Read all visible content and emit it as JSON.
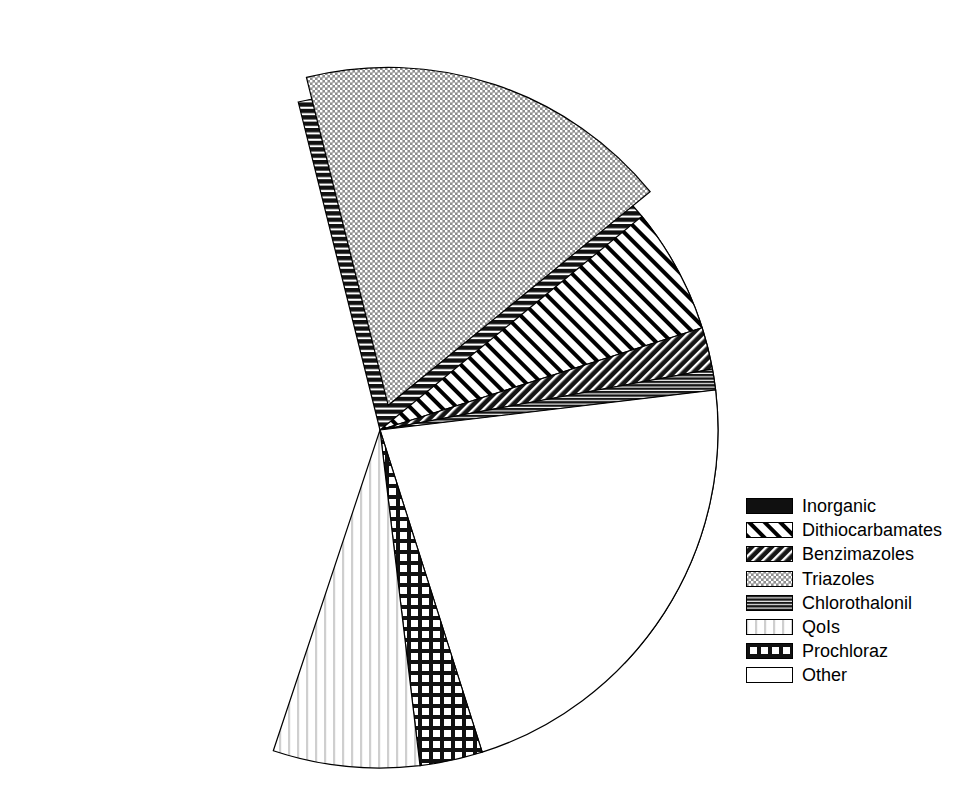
{
  "chart_data": {
    "type": "pie",
    "title": "",
    "subtitle": "",
    "xlabel": "",
    "ylabel": "",
    "legend_position": "right",
    "grid": false,
    "start_angle_deg": -104,
    "direction": "clockwise",
    "center": {
      "x": 380,
      "y": 430
    },
    "radius": 338,
    "categories": [
      "Inorganic",
      "Triazoles",
      "Dithiocarbamates",
      "Benzimazoles",
      "Chlorothalonil",
      "Other",
      "Prochloraz",
      "QoIs"
    ],
    "values": [
      41,
      18,
      6,
      2,
      1,
      22,
      3,
      7
    ],
    "slices": [
      {
        "label": "Inorganic",
        "value": 41,
        "pattern": "horizontal-stripes-dark",
        "fill": "#111111",
        "exploded": false,
        "start_deg": -104,
        "end_deg": 43.6
      },
      {
        "label": "Triazoles",
        "value": 18,
        "pattern": "gray-crosshatch-dots",
        "fill": "#8a8a8a",
        "exploded": true,
        "explode_offset": 26,
        "start_deg": -104,
        "end_deg": -39.2
      },
      {
        "label": "Dithiocarbamates",
        "value": 6,
        "pattern": "diagonal-stripes",
        "fill": "#ffffff",
        "exploded": false,
        "start_deg": -39.2,
        "end_deg": -17.6
      },
      {
        "label": "Benzimazoles",
        "value": 2,
        "pattern": "dense-back-diagonal",
        "fill": "#1a1a1a",
        "exploded": false,
        "start_deg": -17.6,
        "end_deg": -10.4
      },
      {
        "label": "Chlorothalonil",
        "value": 1,
        "pattern": "fine-horizontal-dark",
        "fill": "#1a1a1a",
        "exploded": false,
        "start_deg": -10.4,
        "end_deg": -6.8
      },
      {
        "label": "Other",
        "value": 22,
        "pattern": "solid-white",
        "fill": "#ffffff",
        "exploded": false,
        "start_deg": -6.8,
        "end_deg": 72.4
      },
      {
        "label": "Prochloraz",
        "value": 3,
        "pattern": "grid-crosshatch",
        "fill": "#ffffff",
        "exploded": false,
        "start_deg": 72.4,
        "end_deg": 83.2
      },
      {
        "label": "QoIs",
        "value": 7,
        "pattern": "vertical-stripes-light",
        "fill": "#ffffff",
        "exploded": false,
        "start_deg": 83.2,
        "end_deg": 108.4
      }
    ]
  },
  "legend": {
    "items": [
      {
        "label": "Inorganic",
        "pattern": "solid-black",
        "swatch_name": "legend-swatch-inorganic"
      },
      {
        "label": "Dithiocarbamates",
        "pattern": "diagonal-stripes",
        "swatch_name": "legend-swatch-dithiocarbamates"
      },
      {
        "label": "Benzimazoles",
        "pattern": "dense-back-diagonal",
        "swatch_name": "legend-swatch-benzimazoles"
      },
      {
        "label": "Triazoles",
        "pattern": "gray-crosshatch-dots",
        "swatch_name": "legend-swatch-triazoles"
      },
      {
        "label": "Chlorothalonil",
        "pattern": "fine-horizontal-dark",
        "swatch_name": "legend-swatch-chlorothalonil"
      },
      {
        "label": "QoIs",
        "pattern": "vertical-stripes-light",
        "swatch_name": "legend-swatch-qols"
      },
      {
        "label": "Prochloraz",
        "pattern": "grid-crosshatch",
        "swatch_name": "legend-swatch-prochloraz"
      },
      {
        "label": "Other",
        "pattern": "solid-white",
        "swatch_name": "legend-swatch-other"
      }
    ]
  },
  "colors": {
    "outline": "#000000",
    "dark": "#111111",
    "gray": "#8a8a8a",
    "background": "#ffffff"
  }
}
